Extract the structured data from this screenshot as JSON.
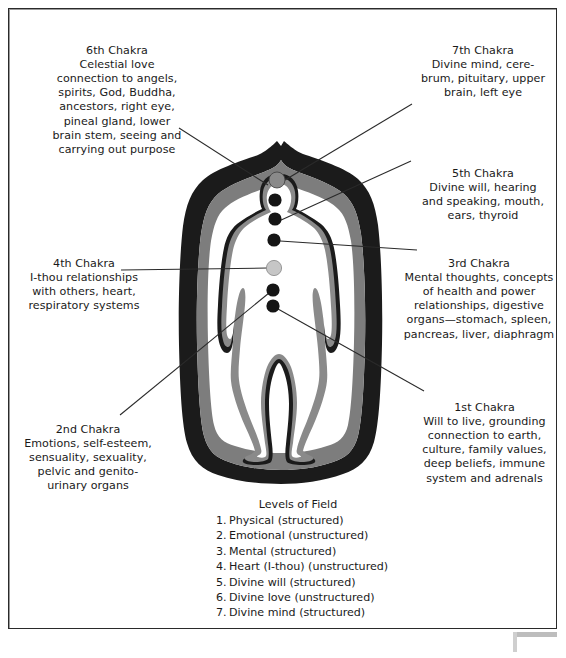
{
  "figure": {
    "title_present": false,
    "colors": {
      "aura_outer_band": "#1b1b1b",
      "aura_middle_band": "#7d7d7d",
      "aura_inner_field": "#ffffff",
      "body_outline": "#1b1b1b",
      "body_inner_band": "#8a8a8a",
      "body_fill": "#ffffff",
      "chakra_dot": "#151515",
      "chakra_dot_heart": "#c6c6c6",
      "chakra_dot_crown": "#8a8a8a",
      "leader_line": "#2a2a2a",
      "frame_border": "#2a2a2a",
      "page_background": "#ffffff"
    },
    "chakra_dots": [
      {
        "name": "crown-7th",
        "cx": 277,
        "cy": 180,
        "r": 7.5,
        "fill": "#8a8a8a"
      },
      {
        "name": "brow-6th",
        "cx": 275,
        "cy": 200,
        "r": 6.5,
        "fill": "#151515"
      },
      {
        "name": "throat-5th",
        "cx": 275,
        "cy": 219,
        "r": 6.5,
        "fill": "#151515"
      },
      {
        "name": "solar-3rd",
        "cx": 274,
        "cy": 240,
        "r": 6.5,
        "fill": "#151515"
      },
      {
        "name": "heart-4th",
        "cx": 274,
        "cy": 268,
        "r": 7.5,
        "fill": "#c6c6c6"
      },
      {
        "name": "sacral-2nd",
        "cx": 273,
        "cy": 290,
        "r": 6.5,
        "fill": "#151515"
      },
      {
        "name": "root-1st",
        "cx": 273,
        "cy": 306,
        "r": 6.5,
        "fill": "#151515"
      }
    ]
  },
  "notes": [
    {
      "id": "chakra-6",
      "heading": "6th Chakra",
      "body": "Celestial love\nconnection to angels,\nspirits, God, Buddha,\nancestors, right eye,\npineal gland, lower\nbrain stem, seeing and\ncarrying out purpose"
    },
    {
      "id": "chakra-7",
      "heading": "7th Chakra",
      "body": "Divine mind, cere-\nbrum, pituitary, upper\nbrain, left eye"
    },
    {
      "id": "chakra-5",
      "heading": "5th Chakra",
      "body": "Divine will, hearing\nand speaking, mouth,\nears, thyroid"
    },
    {
      "id": "chakra-3",
      "heading": "3rd Chakra",
      "body": "Mental thoughts, concepts\nof health and power\nrelationships, digestive\norgans—stomach, spleen,\npancreas, liver, diaphragm"
    },
    {
      "id": "chakra-4",
      "heading": "4th Chakra",
      "body": "I-thou relationships\nwith  others, heart,\nrespiratory systems"
    },
    {
      "id": "chakra-2",
      "heading": "2nd Chakra",
      "body": "Emotions, self-esteem,\nsensuality, sexuality,\npelvic and genito-\nurinary organs"
    },
    {
      "id": "chakra-1",
      "heading": "1st Chakra",
      "body": "Will to live, grounding\nconnection to earth,\nculture, family values,\ndeep beliefs, immune\nsystem and adrenals"
    }
  ],
  "levels_of_field": {
    "title": "Levels of Field",
    "items": [
      {
        "num": "1.",
        "label": "Physical (structured)"
      },
      {
        "num": "2.",
        "label": "Emotional (unstructured)"
      },
      {
        "num": "3.",
        "label": "Mental (structured)"
      },
      {
        "num": "4.",
        "label": "Heart (I-thou) (unstructured)"
      },
      {
        "num": "5.",
        "label": "Divine will (structured)"
      },
      {
        "num": "6.",
        "label": "Divine love (unstructured)"
      },
      {
        "num": "7.",
        "label": "Divine mind (structured)"
      }
    ]
  }
}
